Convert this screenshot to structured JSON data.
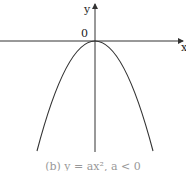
{
  "figure": {
    "x_axis_label": "x",
    "y_axis_label": "y",
    "origin_label": "0",
    "curve": "y = ax^2, a < 0 (downward-opening parabola with vertex at origin)",
    "caption": "(b) y = ax², a < 0"
  },
  "colors": {
    "axis": "#333333",
    "curve": "#333333",
    "background": "#ffffff"
  }
}
